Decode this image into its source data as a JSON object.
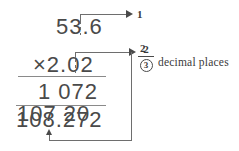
{
  "problem": {
    "multiplicand": "53.6",
    "multiplicand_int": "53",
    "multiplicand_point": ".",
    "multiplicand_frac": "6",
    "multiplier": "×2.02",
    "multiplier_symbol": "×",
    "multiplier_int": "2",
    "multiplier_point": ".",
    "multiplier_frac": "02",
    "partial_product_1": "1 072",
    "partial_product_2": "107 20",
    "total": "108.272",
    "total_int": "108",
    "total_point": ".",
    "total_frac": "272"
  },
  "annotations": {
    "tag_one": "1",
    "tag_two": "2",
    "sum_numerator": "2",
    "sum_result": "3",
    "caption": "decimal places"
  },
  "colors": {
    "ink": "#4a4a4a",
    "line": "#6e6e6e",
    "rule": "#8a8a8a",
    "background": "#ffffff"
  }
}
